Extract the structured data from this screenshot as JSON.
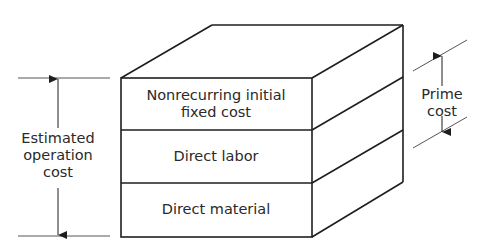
{
  "diagram": {
    "type": "cost-block-3d",
    "layers": [
      {
        "id": "nonrecurring",
        "label_line1": "Nonrecurring initial",
        "label_line2": "fixed cost"
      },
      {
        "id": "labor",
        "label": "Direct labor"
      },
      {
        "id": "material",
        "label": "Direct material"
      }
    ],
    "dimensions": {
      "left": {
        "line1": "Estimated",
        "line2": "operation",
        "line3": "cost"
      },
      "right": {
        "line1": "Prime",
        "line2": "cost"
      }
    },
    "colors": {
      "line": "#1e1e1e",
      "text": "#2a2a2a",
      "thin_line": "#555555",
      "background": "#ffffff"
    }
  }
}
